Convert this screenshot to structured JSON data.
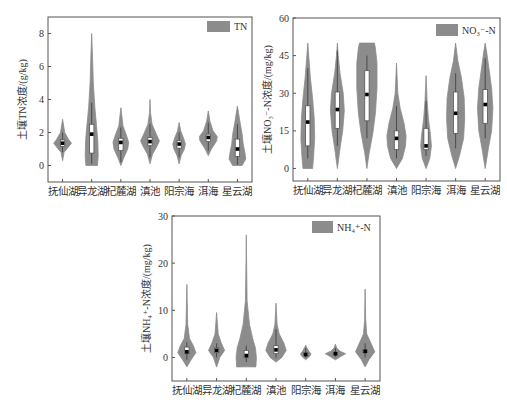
{
  "colors": {
    "violin_fill": "#8c8c8c",
    "box_fill": "#ffffff",
    "box_stroke": "#555555",
    "median_marker": "#000000",
    "axis": "#555555",
    "text": "#333333"
  },
  "chart_data": [
    {
      "id": "tn",
      "type": "violin",
      "title": "",
      "legend": "TN",
      "legend_position": "top-right",
      "xlabel": "",
      "ylabel": "土壤TN浓度/(g/kg)",
      "ylim": [
        -1,
        9
      ],
      "yticks": [
        0,
        2,
        4,
        6,
        8
      ],
      "grid": false,
      "categories": [
        "抚仙湖",
        "异龙湖",
        "杞麓湖",
        "滇池",
        "阳宗海",
        "洱海",
        "星云湖"
      ],
      "series": [
        {
          "name": "抚仙湖",
          "min": 0.3,
          "max": 2.8,
          "q1": 1.15,
          "median": 1.35,
          "q3": 1.55,
          "whisker_low": 0.8,
          "whisker_high": 2.0,
          "mean": 1.35,
          "density": [
            [
              0.3,
              0.0
            ],
            [
              0.8,
              0.15
            ],
            [
              1.1,
              0.55
            ],
            [
              1.35,
              0.85
            ],
            [
              1.6,
              0.55
            ],
            [
              2.0,
              0.2
            ],
            [
              2.8,
              0.0
            ]
          ]
        },
        {
          "name": "异龙湖",
          "min": 0.0,
          "max": 8.0,
          "q1": 0.75,
          "median": 1.9,
          "q3": 2.5,
          "whisker_low": 0.1,
          "whisker_high": 3.8,
          "mean": 1.95,
          "density": [
            [
              0.0,
              0.55
            ],
            [
              0.6,
              0.62
            ],
            [
              1.5,
              0.58
            ],
            [
              2.5,
              0.45
            ],
            [
              3.5,
              0.3
            ],
            [
              5.0,
              0.15
            ],
            [
              7.0,
              0.06
            ],
            [
              8.0,
              0.0
            ]
          ]
        },
        {
          "name": "杞麓湖",
          "min": 0.0,
          "max": 3.5,
          "q1": 0.9,
          "median": 1.4,
          "q3": 1.65,
          "whisker_low": 0.2,
          "whisker_high": 2.3,
          "mean": 1.4,
          "density": [
            [
              0.0,
              0.0
            ],
            [
              0.5,
              0.3
            ],
            [
              1.0,
              0.65
            ],
            [
              1.4,
              0.75
            ],
            [
              1.8,
              0.55
            ],
            [
              2.4,
              0.2
            ],
            [
              3.5,
              0.0
            ]
          ]
        },
        {
          "name": "滇池",
          "min": 0.1,
          "max": 4.0,
          "q1": 1.2,
          "median": 1.45,
          "q3": 1.7,
          "whisker_low": 0.5,
          "whisker_high": 2.5,
          "mean": 1.45,
          "density": [
            [
              0.1,
              0.0
            ],
            [
              0.7,
              0.25
            ],
            [
              1.2,
              0.7
            ],
            [
              1.5,
              0.9
            ],
            [
              1.9,
              0.6
            ],
            [
              2.5,
              0.2
            ],
            [
              3.2,
              0.05
            ],
            [
              4.0,
              0.0
            ]
          ]
        },
        {
          "name": "阳宗海",
          "min": 0.1,
          "max": 2.6,
          "q1": 1.05,
          "median": 1.3,
          "q3": 1.5,
          "whisker_low": 0.5,
          "whisker_high": 2.0,
          "mean": 1.3,
          "density": [
            [
              0.1,
              0.0
            ],
            [
              0.6,
              0.2
            ],
            [
              1.0,
              0.5
            ],
            [
              1.3,
              0.6
            ],
            [
              1.7,
              0.4
            ],
            [
              2.1,
              0.15
            ],
            [
              2.6,
              0.0
            ]
          ]
        },
        {
          "name": "洱海",
          "min": 0.6,
          "max": 3.3,
          "q1": 1.45,
          "median": 1.7,
          "q3": 1.9,
          "whisker_low": 0.9,
          "whisker_high": 2.6,
          "mean": 1.7,
          "density": [
            [
              0.6,
              0.0
            ],
            [
              1.0,
              0.3
            ],
            [
              1.5,
              0.8
            ],
            [
              1.75,
              0.85
            ],
            [
              2.1,
              0.45
            ],
            [
              2.7,
              0.15
            ],
            [
              3.3,
              0.0
            ]
          ]
        },
        {
          "name": "星云湖",
          "min": 0.0,
          "max": 3.6,
          "q1": 0.55,
          "median": 1.0,
          "q3": 1.6,
          "whisker_low": 0.05,
          "whisker_high": 2.5,
          "mean": 1.0,
          "density": [
            [
              0.0,
              0.45
            ],
            [
              0.4,
              0.8
            ],
            [
              0.8,
              0.7
            ],
            [
              1.3,
              0.55
            ],
            [
              1.9,
              0.45
            ],
            [
              2.6,
              0.25
            ],
            [
              3.6,
              0.0
            ]
          ]
        }
      ]
    },
    {
      "id": "no3",
      "type": "violin",
      "title": "",
      "legend": "NO₃⁻-N",
      "legend_position": "top-right",
      "xlabel": "",
      "ylabel": "土壤NO₃⁻-N浓度/(mg/kg)",
      "ylim": [
        -5,
        60
      ],
      "yticks": [
        0,
        15,
        30,
        45,
        60
      ],
      "grid": false,
      "categories": [
        "抚仙湖",
        "异龙湖",
        "杞麓湖",
        "滇池",
        "阳宗海",
        "洱海",
        "星云湖"
      ],
      "series": [
        {
          "name": "抚仙湖",
          "min": 0,
          "max": 50,
          "q1": 9,
          "median": 18.5,
          "q3": 25,
          "whisker_low": 4,
          "whisker_high": 40,
          "mean": 18.5,
          "density": [
            [
              0,
              0.45
            ],
            [
              5,
              0.55
            ],
            [
              12,
              0.65
            ],
            [
              20,
              0.6
            ],
            [
              28,
              0.45
            ],
            [
              36,
              0.25
            ],
            [
              44,
              0.1
            ],
            [
              50,
              0.0
            ]
          ]
        },
        {
          "name": "异龙湖",
          "min": 0,
          "max": 50,
          "q1": 16,
          "median": 23.5,
          "q3": 30.5,
          "whisker_low": 9,
          "whisker_high": 47,
          "mean": 23.5,
          "density": [
            [
              0,
              0.0
            ],
            [
              8,
              0.25
            ],
            [
              15,
              0.5
            ],
            [
              23,
              0.65
            ],
            [
              30,
              0.55
            ],
            [
              38,
              0.25
            ],
            [
              45,
              0.08
            ],
            [
              50,
              0.0
            ]
          ]
        },
        {
          "name": "杞麓湖",
          "min": 0,
          "max": 50,
          "q1": 19,
          "median": 29.5,
          "q3": 39,
          "whisker_low": 12,
          "whisker_high": 45,
          "mean": 29.5,
          "density": [
            [
              0,
              0.0
            ],
            [
              6,
              0.2
            ],
            [
              14,
              0.55
            ],
            [
              22,
              0.8
            ],
            [
              32,
              0.95
            ],
            [
              42,
              0.95
            ],
            [
              48,
              0.8
            ],
            [
              50,
              0.7
            ]
          ]
        },
        {
          "name": "滇池",
          "min": 0,
          "max": 42,
          "q1": 7.5,
          "median": 12,
          "q3": 15,
          "whisker_low": 4,
          "whisker_high": 25,
          "mean": 12,
          "density": [
            [
              0,
              0.0
            ],
            [
              4,
              0.55
            ],
            [
              9,
              0.85
            ],
            [
              13,
              0.9
            ],
            [
              18,
              0.7
            ],
            [
              24,
              0.35
            ],
            [
              30,
              0.12
            ],
            [
              42,
              0.0
            ]
          ]
        },
        {
          "name": "阳宗海",
          "min": 0,
          "max": 37,
          "q1": 7.5,
          "median": 9,
          "q3": 16,
          "whisker_low": 5,
          "whisker_high": 27,
          "mean": 9,
          "density": [
            [
              0,
              0.0
            ],
            [
              4,
              0.35
            ],
            [
              9,
              0.5
            ],
            [
              14,
              0.4
            ],
            [
              20,
              0.22
            ],
            [
              27,
              0.1
            ],
            [
              37,
              0.0
            ]
          ]
        },
        {
          "name": "洱海",
          "min": 0,
          "max": 50,
          "q1": 14,
          "median": 22,
          "q3": 30.5,
          "whisker_low": 8,
          "whisker_high": 38,
          "mean": 22,
          "density": [
            [
              0,
              0.0
            ],
            [
              5,
              0.35
            ],
            [
              12,
              0.75
            ],
            [
              20,
              0.85
            ],
            [
              28,
              0.8
            ],
            [
              36,
              0.55
            ],
            [
              43,
              0.2
            ],
            [
              50,
              0.0
            ]
          ]
        },
        {
          "name": "星云湖",
          "min": 0,
          "max": 50,
          "q1": 18,
          "median": 25.5,
          "q3": 31.5,
          "whisker_low": 12,
          "whisker_high": 44,
          "mean": 25.5,
          "density": [
            [
              0,
              0.0
            ],
            [
              8,
              0.3
            ],
            [
              15,
              0.6
            ],
            [
              24,
              0.72
            ],
            [
              32,
              0.6
            ],
            [
              40,
              0.35
            ],
            [
              46,
              0.15
            ],
            [
              50,
              0.0
            ]
          ]
        }
      ]
    },
    {
      "id": "nh4",
      "type": "violin",
      "title": "",
      "legend": "NH₄⁺-N",
      "legend_position": "top-right",
      "xlabel": "",
      "ylabel": "土壤NH₄⁺-N浓度/(mg/kg)",
      "ylim": [
        -5,
        30
      ],
      "yticks": [
        0,
        10,
        20,
        30
      ],
      "grid": false,
      "categories": [
        "抚仙湖",
        "异龙湖",
        "杞麓湖",
        "滇池",
        "阳宗海",
        "洱海",
        "星云湖"
      ],
      "series": [
        {
          "name": "抚仙湖",
          "min": -2,
          "max": 15.5,
          "q1": 0.8,
          "median": 1.2,
          "q3": 2.2,
          "whisker_low": -0.5,
          "whisker_high": 3.2,
          "mean": 1.2,
          "density": [
            [
              -2,
              0.0
            ],
            [
              -0.5,
              0.4
            ],
            [
              1,
              0.85
            ],
            [
              2.5,
              0.6
            ],
            [
              4,
              0.25
            ],
            [
              7,
              0.08
            ],
            [
              15.5,
              0.0
            ]
          ]
        },
        {
          "name": "异龙湖",
          "min": -2,
          "max": 9.5,
          "q1": 1.0,
          "median": 1.5,
          "q3": 2.0,
          "whisker_low": 0,
          "whisker_high": 3.0,
          "mean": 1.5,
          "density": [
            [
              -2,
              0.0
            ],
            [
              0,
              0.3
            ],
            [
              1.5,
              0.75
            ],
            [
              3,
              0.45
            ],
            [
              5,
              0.15
            ],
            [
              9.5,
              0.0
            ]
          ]
        },
        {
          "name": "杞麓湖",
          "min": -2,
          "max": 26,
          "q1": 0.0,
          "median": 0.4,
          "q3": 1.5,
          "whisker_low": -1,
          "whisker_high": 2.5,
          "mean": 0.4,
          "density": [
            [
              -2,
              0.9
            ],
            [
              0,
              0.95
            ],
            [
              2,
              0.85
            ],
            [
              4,
              0.6
            ],
            [
              7,
              0.3
            ],
            [
              12,
              0.08
            ],
            [
              20,
              0.03
            ],
            [
              26,
              0.0
            ]
          ]
        },
        {
          "name": "滇池",
          "min": -1,
          "max": 11.5,
          "q1": 0.8,
          "median": 1.6,
          "q3": 2.5,
          "whisker_low": 0,
          "whisker_high": 6.0,
          "mean": 1.6,
          "density": [
            [
              -1,
              0.0
            ],
            [
              0,
              0.55
            ],
            [
              1.5,
              0.95
            ],
            [
              3,
              0.75
            ],
            [
              5,
              0.3
            ],
            [
              7,
              0.1
            ],
            [
              11.5,
              0.0
            ]
          ]
        },
        {
          "name": "阳宗海",
          "min": -0.5,
          "max": 2.6,
          "q1": 0.4,
          "median": 0.6,
          "q3": 1.0,
          "whisker_low": 0,
          "whisker_high": 2.0,
          "mean": 0.6,
          "density": [
            [
              -0.5,
              0.0
            ],
            [
              0.2,
              0.35
            ],
            [
              0.7,
              0.5
            ],
            [
              1.3,
              0.3
            ],
            [
              2.0,
              0.12
            ],
            [
              2.6,
              0.0
            ]
          ]
        },
        {
          "name": "洱海",
          "min": -0.5,
          "max": 2.8,
          "q1": 0.5,
          "median": 0.8,
          "q3": 1.0,
          "whisker_low": 0.1,
          "whisker_high": 2.0,
          "mean": 0.8,
          "density": [
            [
              -0.5,
              0.0
            ],
            [
              0.2,
              0.5
            ],
            [
              0.8,
              0.95
            ],
            [
              1.3,
              0.45
            ],
            [
              2.0,
              0.12
            ],
            [
              2.8,
              0.0
            ]
          ]
        },
        {
          "name": "星云湖",
          "min": -2,
          "max": 14.5,
          "q1": 1.0,
          "median": 1.3,
          "q3": 1.6,
          "whisker_low": 0,
          "whisker_high": 3.0,
          "mean": 1.3,
          "density": [
            [
              -2,
              0.0
            ],
            [
              -0.5,
              0.35
            ],
            [
              1.2,
              0.9
            ],
            [
              3,
              0.55
            ],
            [
              5,
              0.15
            ],
            [
              8,
              0.05
            ],
            [
              14.5,
              0.0
            ]
          ]
        }
      ]
    }
  ],
  "layout": [
    {
      "frame": [
        48,
        17,
        252,
        182
      ],
      "legend_box": [
        207,
        21,
        230,
        32
      ]
    },
    {
      "frame": [
        293,
        18,
        500,
        181
      ],
      "legend_box": [
        436,
        24,
        458,
        36
      ]
    },
    {
      "frame": [
        172,
        216,
        380,
        381
      ],
      "legend_box": [
        312,
        221,
        333,
        233
      ]
    }
  ]
}
